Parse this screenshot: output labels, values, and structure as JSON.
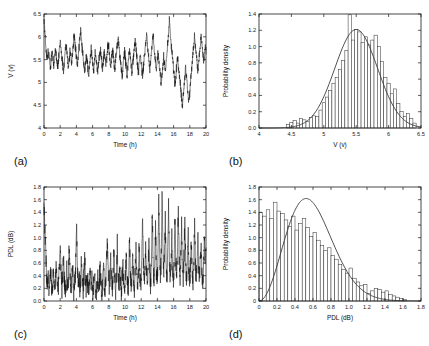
{
  "figure": {
    "background": "#ffffff",
    "line_color": "#141414",
    "axis_color": "#1a1a1a",
    "panel_count": 4
  },
  "panels": [
    {
      "tag": "(a)",
      "name": "voltage-time-series",
      "type": "line",
      "xlabel": "Time (h)",
      "ylabel": "V (v)",
      "xlim": [
        0,
        20
      ],
      "ylim": [
        4,
        6.5
      ],
      "xticks": [
        0,
        2,
        4,
        6,
        8,
        10,
        12,
        14,
        16,
        18,
        20
      ],
      "xticklabels": [
        "0",
        "2",
        "4",
        "6",
        "8",
        "10",
        "12",
        "14",
        "16",
        "18",
        "20"
      ],
      "yticks": [
        4,
        4.5,
        5,
        5.5,
        6,
        6.5
      ],
      "yticklabels": [
        "4",
        "4.5",
        "5",
        "5.5",
        "6",
        "6.5"
      ],
      "grid": false
    },
    {
      "tag": "(b)",
      "name": "voltage-histogram",
      "type": "bar",
      "xlabel": "V (v)",
      "ylabel": "Probability density",
      "xlim": [
        4,
        6.5
      ],
      "ylim": [
        0,
        1.4
      ],
      "xticks": [
        4,
        4.5,
        5,
        5.5,
        6,
        6.5
      ],
      "xticklabels": [
        "4",
        "4.5",
        "5",
        "5.5",
        "6",
        "6.5"
      ],
      "yticks": [
        0,
        0.2,
        0.4,
        0.6,
        0.8,
        1.0,
        1.2,
        1.4
      ],
      "yticklabels": [
        "0.0",
        "0.2",
        "0.4",
        "0.6",
        "0.8",
        "1.0",
        "1.2",
        "1.4"
      ],
      "grid": false,
      "fit_curve": "gaussian"
    },
    {
      "tag": "(c)",
      "name": "pdl-time-series",
      "type": "line",
      "xlabel": "Time (h)",
      "ylabel": "PDL (dB)",
      "xlim": [
        0,
        20
      ],
      "ylim": [
        0,
        1.8
      ],
      "xticks": [
        0,
        2,
        4,
        6,
        8,
        10,
        12,
        14,
        16,
        18,
        20
      ],
      "xticklabels": [
        "0",
        "2",
        "4",
        "6",
        "8",
        "10",
        "12",
        "14",
        "16",
        "18",
        "20"
      ],
      "yticks": [
        0,
        0.2,
        0.4,
        0.6,
        0.8,
        1.0,
        1.2,
        1.4,
        1.6,
        1.8
      ],
      "yticklabels": [
        "0.0",
        "0.2",
        "0.4",
        "0.6",
        "0.8",
        "1.0",
        "1.2",
        "1.4",
        "1.6",
        "1.8"
      ],
      "grid": false
    },
    {
      "tag": "(d)",
      "name": "pdl-histogram",
      "type": "bar",
      "xlabel": "PDL (dB)",
      "ylabel": "Probability density",
      "xlim": [
        0,
        1.8
      ],
      "ylim": [
        0,
        1.8
      ],
      "xticks": [
        0,
        0.2,
        0.4,
        0.6,
        0.8,
        1.0,
        1.2,
        1.4,
        1.6,
        1.8
      ],
      "xticklabels": [
        "0",
        "0.2",
        "0.4",
        "0.6",
        "0.8",
        "1.0",
        "1.2",
        "1.4",
        "1.6",
        "1.8"
      ],
      "yticks": [
        0,
        0.2,
        0.4,
        0.6,
        0.8,
        1.0,
        1.2,
        1.4,
        1.6,
        1.8
      ],
      "yticklabels": [
        "0",
        "0.2",
        "0.4",
        "0.6",
        "0.8",
        "1.0",
        "1.2",
        "1.4",
        "1.6",
        "1.8"
      ],
      "grid": false,
      "fit_curve": "maxwellian"
    }
  ],
  "chart_data": [
    {
      "type": "line",
      "panel": "(a)",
      "title": "",
      "xlabel": "Time (h)",
      "ylabel": "V (v)",
      "xlim": [
        0,
        20
      ],
      "ylim": [
        4,
        6.5
      ],
      "grid": false,
      "legend": null,
      "description": "Measured voltage V fluctuating around a mean near 5.5 V over a 20 hour record, with a high initial value near 6.4 V and excursions between about 4.4 and 6.4 V.",
      "series": [
        {
          "name": "V",
          "mean": 5.5,
          "std": 0.32,
          "sample_count": 1200,
          "values": [
            6.42,
            6.1,
            5.85,
            5.62,
            5.48,
            5.72,
            5.58,
            5.4,
            5.3,
            5.55,
            5.68,
            5.5,
            5.35,
            5.6,
            5.78,
            5.62,
            5.45,
            5.3,
            5.52,
            5.7,
            5.9,
            5.72,
            5.55,
            5.38,
            5.25,
            5.45,
            5.68,
            5.85,
            5.65,
            5.48,
            5.32,
            5.5,
            5.72,
            5.58,
            5.4,
            5.6,
            5.82,
            6.02,
            5.88,
            5.7,
            5.52,
            5.35,
            5.55,
            5.78,
            5.95,
            6.12,
            5.92,
            5.72,
            5.55,
            5.38,
            5.2,
            5.42,
            5.62,
            5.48,
            5.3,
            5.15,
            5.35,
            5.55,
            5.72,
            5.58,
            5.42,
            5.25,
            5.45,
            5.65,
            5.52,
            5.35,
            5.18,
            5.38,
            5.58,
            5.75,
            5.6,
            5.42,
            5.28,
            5.48,
            5.68,
            5.55,
            5.38,
            5.52,
            5.72,
            5.88,
            5.7,
            5.52,
            5.35,
            5.55,
            5.75,
            5.6,
            5.45,
            5.28,
            5.48,
            5.68,
            5.85,
            6.0,
            5.82,
            5.62,
            5.45,
            5.28,
            5.12,
            5.32,
            5.52,
            5.68,
            5.5,
            5.32,
            5.15,
            5.35,
            5.55,
            5.72,
            5.55,
            5.38,
            5.22,
            5.42,
            5.62,
            5.78,
            5.92,
            5.75,
            5.55,
            5.38,
            5.22,
            5.42,
            5.62,
            5.48,
            5.3,
            5.12,
            5.32,
            5.52,
            5.7,
            5.85,
            6.05,
            5.85,
            5.65,
            5.45,
            5.28,
            5.48,
            5.68,
            5.85,
            6.0,
            5.82,
            5.62,
            5.42,
            5.25,
            5.45,
            5.65,
            5.5,
            5.32,
            5.15,
            4.98,
            5.18,
            5.38,
            5.58,
            5.42,
            5.25,
            5.45,
            5.68,
            5.88,
            6.08,
            6.38,
            6.12,
            5.88,
            5.68,
            5.48,
            5.3,
            5.12,
            4.95,
            5.15,
            5.35,
            5.55,
            5.38,
            5.2,
            5.02,
            4.85,
            4.65,
            4.48,
            4.7,
            4.92,
            5.12,
            5.32,
            5.15,
            4.95,
            4.75,
            4.55,
            4.78,
            5.0,
            5.22,
            5.42,
            5.62,
            5.82,
            6.02,
            5.82,
            5.62,
            5.42,
            5.22,
            5.42,
            5.62,
            5.82,
            6.05,
            5.85,
            5.65,
            5.45,
            5.6,
            5.8,
            5.62
          ]
        }
      ]
    },
    {
      "type": "bar",
      "panel": "(b)",
      "title": "",
      "xlabel": "V (v)",
      "ylabel": "Probability density",
      "xlim": [
        4,
        6.5
      ],
      "ylim": [
        0,
        1.4
      ],
      "grid": false,
      "bin_width": 0.05,
      "description": "Histogram of the voltage samples with an overlaid Gaussian fit peaking near 1.21 at V = 5.5 v.",
      "fit": {
        "name": "Gaussian fit",
        "kind": "gaussian",
        "mean": 5.5,
        "sigma": 0.33,
        "peak": 1.21
      },
      "bins": [
        4.45,
        4.5,
        4.55,
        4.6,
        4.65,
        4.7,
        4.75,
        4.8,
        4.85,
        4.9,
        4.95,
        5.0,
        5.05,
        5.1,
        5.15,
        5.2,
        5.25,
        5.3,
        5.35,
        5.4,
        5.45,
        5.5,
        5.55,
        5.6,
        5.65,
        5.7,
        5.75,
        5.8,
        5.85,
        5.9,
        5.95,
        6.0,
        6.05,
        6.1,
        6.15,
        6.2,
        6.25,
        6.3,
        6.35,
        6.4
      ],
      "values": [
        0.04,
        0.07,
        0.09,
        0.06,
        0.12,
        0.1,
        0.08,
        0.13,
        0.15,
        0.14,
        0.22,
        0.31,
        0.38,
        0.46,
        0.55,
        0.62,
        0.72,
        0.83,
        0.95,
        1.39,
        1.08,
        1.21,
        1.18,
        1.05,
        1.12,
        1.02,
        1.08,
        1.14,
        1.0,
        0.82,
        0.62,
        0.55,
        0.42,
        0.48,
        0.3,
        0.2,
        0.14,
        0.18,
        0.12,
        0.06
      ]
    },
    {
      "type": "line",
      "panel": "(c)",
      "title": "",
      "xlabel": "Time (h)",
      "ylabel": "PDL (dB)",
      "xlim": [
        0,
        20
      ],
      "ylim": [
        0,
        1.8
      ],
      "grid": false,
      "legend": null,
      "description": "Polarization dependent loss over 20 hours, mostly between 0 and 0.8 dB early on with increasingly frequent spikes up to about 1.8 dB after hour 13.",
      "series": [
        {
          "name": "PDL",
          "mean": 0.45,
          "sample_count": 1200,
          "values": [
            1.52,
            1.18,
            0.82,
            0.45,
            0.22,
            0.38,
            0.15,
            0.3,
            0.52,
            0.25,
            0.1,
            0.28,
            0.44,
            0.18,
            0.32,
            0.6,
            0.26,
            0.12,
            0.34,
            0.55,
            0.88,
            0.42,
            0.2,
            0.36,
            0.7,
            0.3,
            0.14,
            0.26,
            0.48,
            0.22,
            0.38,
            0.92,
            0.4,
            0.18,
            0.3,
            0.58,
            0.24,
            0.1,
            0.32,
            0.66,
            1.2,
            0.52,
            0.26,
            0.4,
            0.18,
            0.34,
            0.62,
            0.28,
            0.12,
            0.36,
            0.7,
            0.3,
            0.16,
            0.42,
            0.22,
            0.08,
            0.26,
            0.5,
            0.2,
            0.34,
            0.12,
            0.28,
            0.46,
            0.18,
            0.06,
            0.24,
            0.4,
            0.16,
            0.3,
            0.54,
            0.22,
            0.1,
            0.32,
            0.6,
            0.26,
            0.14,
            0.38,
            0.72,
            0.95,
            0.44,
            0.2,
            0.36,
            0.66,
            0.3,
            0.16,
            0.42,
            0.8,
            0.34,
            0.18,
            0.46,
            0.88,
            0.38,
            0.22,
            0.52,
            0.28,
            0.14,
            0.36,
            0.64,
            0.3,
            0.18,
            0.42,
            0.76,
            0.32,
            0.16,
            0.38,
            1.08,
            0.46,
            0.24,
            0.4,
            0.7,
            0.3,
            0.18,
            0.44,
            0.82,
            0.36,
            0.2,
            0.48,
            0.92,
            0.4,
            0.22,
            0.52,
            1.45,
            0.62,
            0.3,
            0.48,
            0.86,
            0.38,
            0.24,
            0.56,
            1.05,
            0.46,
            0.26,
            0.6,
            1.52,
            0.68,
            0.34,
            0.54,
            1.18,
            0.5,
            0.28,
            0.64,
            1.62,
            0.78,
            0.4,
            0.7,
            1.8,
            0.82,
            0.44,
            0.66,
            1.3,
            0.56,
            0.32,
            0.72,
            1.55,
            0.64,
            0.36,
            0.58,
            1.1,
            0.48,
            0.3,
            0.68,
            1.4,
            0.6,
            0.34,
            0.76,
            1.48,
            0.7,
            0.38,
            0.62,
            1.22,
            0.54,
            0.3,
            0.7,
            1.35,
            0.58,
            0.34,
            0.66,
            1.15,
            0.5,
            0.28,
            0.6,
            0.95,
            0.44,
            0.26,
            0.58,
            1.28,
            0.56,
            0.32,
            0.64,
            1.05,
            0.48,
            0.3,
            0.72,
            0.86,
            0.42,
            0.26,
            0.56,
            0.9,
            0.46,
            0.84
          ]
        }
      ]
    },
    {
      "type": "bar",
      "panel": "(d)",
      "title": "",
      "xlabel": "PDL (dB)",
      "ylabel": "Probability density",
      "xlim": [
        0,
        1.8
      ],
      "ylim": [
        0,
        1.8
      ],
      "grid": false,
      "bin_width": 0.04,
      "description": "Histogram of PDL values with an overlaid Maxwellian fit that starts near 1.47, peaks about 1.5 near 0.2 dB and decays to near zero by 1.6 dB.",
      "fit": {
        "name": "Maxwellian fit",
        "kind": "maxwellian",
        "sigma": 0.37,
        "peak": 1.5,
        "peak_position": 0.2
      },
      "bins": [
        0.02,
        0.06,
        0.1,
        0.14,
        0.18,
        0.22,
        0.26,
        0.3,
        0.34,
        0.38,
        0.42,
        0.46,
        0.5,
        0.54,
        0.58,
        0.62,
        0.66,
        0.7,
        0.74,
        0.78,
        0.82,
        0.86,
        0.9,
        0.94,
        0.98,
        1.02,
        1.06,
        1.1,
        1.14,
        1.18,
        1.22,
        1.26,
        1.3,
        1.34,
        1.38,
        1.42,
        1.46,
        1.5,
        1.54,
        1.58,
        1.62
      ],
      "values": [
        1.4,
        1.34,
        1.44,
        1.3,
        1.56,
        1.42,
        1.38,
        1.28,
        1.18,
        1.34,
        1.12,
        1.22,
        1.3,
        1.16,
        1.02,
        1.08,
        0.96,
        0.88,
        0.8,
        0.84,
        0.72,
        0.66,
        0.58,
        0.5,
        0.44,
        0.52,
        0.36,
        0.3,
        0.24,
        0.26,
        0.12,
        0.16,
        0.2,
        0.18,
        0.14,
        0.16,
        0.1,
        0.08,
        0.06,
        0.04,
        0.02
      ]
    }
  ]
}
